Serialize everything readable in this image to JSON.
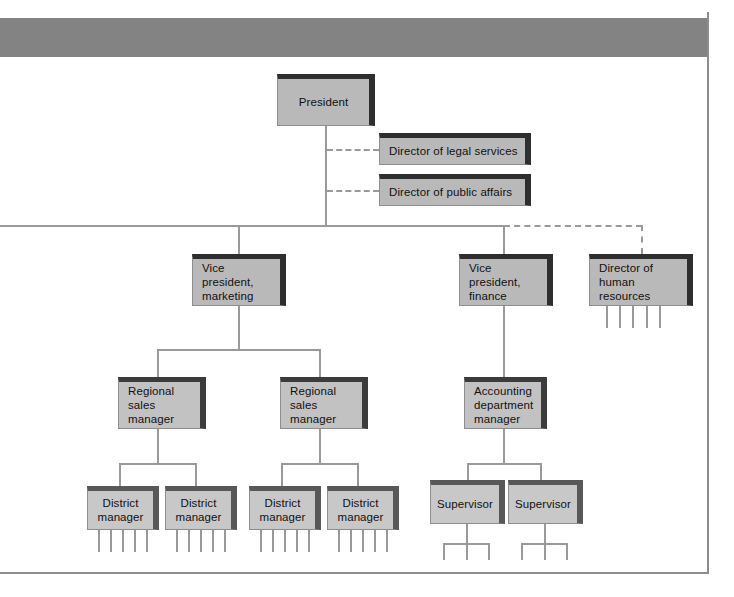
{
  "diagram": {
    "colors": {
      "header_bar": "#838383",
      "box_face": "#b9b9b9",
      "box_shadow": "#2e2e2e",
      "connector": "#9a9a9a",
      "frame": "#8d8d8d",
      "text": "#111111"
    },
    "nodes": [
      {
        "id": "president",
        "label": "President"
      },
      {
        "id": "legal",
        "label": "Director of legal services"
      },
      {
        "id": "public-affairs",
        "label": "Director of public affairs"
      },
      {
        "id": "vp-marketing",
        "label": "Vice president,\nmarketing"
      },
      {
        "id": "vp-finance",
        "label": "Vice president,\nfinance"
      },
      {
        "id": "hr",
        "label": "Director of\nhuman resources"
      },
      {
        "id": "rsm-1",
        "label": "Regional\nsales manager"
      },
      {
        "id": "rsm-2",
        "label": "Regional\nsales manager"
      },
      {
        "id": "acct-mgr",
        "label": "Accounting\ndepartment\nmanager"
      },
      {
        "id": "dm-1",
        "label": "District\nmanager"
      },
      {
        "id": "dm-2",
        "label": "District\nmanager"
      },
      {
        "id": "dm-3",
        "label": "District\nmanager"
      },
      {
        "id": "dm-4",
        "label": "District\nmanager"
      },
      {
        "id": "sup-1",
        "label": "Supervisor"
      },
      {
        "id": "sup-2",
        "label": "Supervisor"
      }
    ],
    "relationships": {
      "solid_reporting": [
        [
          "president",
          "vp-marketing"
        ],
        [
          "president",
          "vp-finance"
        ],
        [
          "vp-marketing",
          "rsm-1"
        ],
        [
          "vp-marketing",
          "rsm-2"
        ],
        [
          "vp-finance",
          "acct-mgr"
        ],
        [
          "rsm-1",
          "dm-1"
        ],
        [
          "rsm-1",
          "dm-2"
        ],
        [
          "rsm-2",
          "dm-3"
        ],
        [
          "rsm-2",
          "dm-4"
        ],
        [
          "acct-mgr",
          "sup-1"
        ],
        [
          "acct-mgr",
          "sup-2"
        ]
      ],
      "dashed_staff": [
        [
          "president",
          "legal"
        ],
        [
          "president",
          "public-affairs"
        ],
        [
          "president",
          "hr"
        ]
      ]
    },
    "leaf_stubs": {
      "district_manager_legs": 5,
      "human_resources_legs": 5,
      "supervisor_branch_legs": 3
    }
  }
}
